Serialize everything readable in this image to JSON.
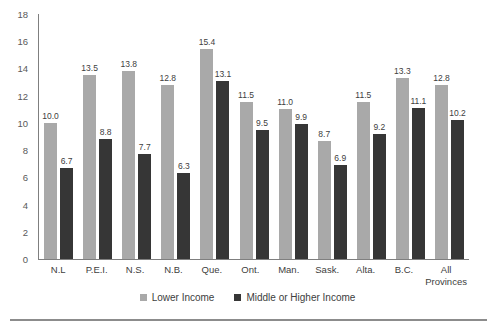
{
  "chart_data": {
    "type": "bar",
    "title": "",
    "xlabel": "",
    "ylabel": "",
    "categories": [
      "N.L",
      "P.E.I.",
      "N.S.",
      "N.B.",
      "Que.",
      "Ont.",
      "Man.",
      "Sask.",
      "Alta.",
      "B.C.",
      "All Provinces"
    ],
    "series": [
      {
        "name": "Lower Income",
        "color": "#a9a9a9",
        "values": [
          10.0,
          13.5,
          13.8,
          12.8,
          15.4,
          11.5,
          11.0,
          8.7,
          11.5,
          13.3,
          12.8
        ]
      },
      {
        "name": "Middle or Higher Income",
        "color": "#363636",
        "values": [
          6.7,
          8.8,
          7.7,
          6.3,
          13.1,
          9.5,
          9.9,
          6.9,
          9.2,
          11.1,
          10.2
        ]
      }
    ],
    "ylim": [
      0,
      18
    ],
    "yticks": [
      0,
      2,
      4,
      6,
      8,
      10,
      12,
      14,
      16,
      18
    ],
    "grid": false,
    "legend_position": "bottom",
    "value_label_decimals": 1
  },
  "colors": {
    "background": "#ffffff",
    "axis_line": "#7f7f7f",
    "tick_text": "#595959",
    "value_label_text": "#404040",
    "category_text": "#404040",
    "legend_text": "#404040",
    "divider": "#8c8c8c"
  }
}
